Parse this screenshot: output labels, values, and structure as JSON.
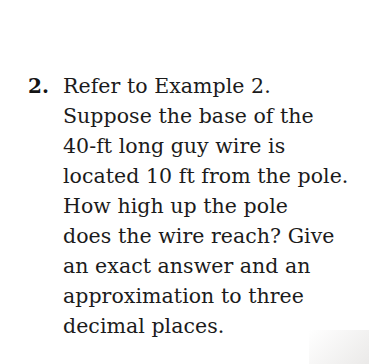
{
  "document": {
    "background_color": "#ffffff",
    "text_color": "#1b1b1b"
  },
  "problem": {
    "marker": "2.",
    "lines": [
      "Refer to Example 2.",
      "Suppose the base of the",
      "40-ft long guy wire is",
      "located 10 ft from the pole.",
      "How high up the pole",
      "does the wire reach? Give",
      "an exact answer and an",
      "approximation to three",
      "decimal places."
    ],
    "full_text": "Refer to Example 2. Suppose the base of the 40-ft long guy wire is located 10 ft from the pole. How high up the pole does the wire reach? Give an exact answer and an approximation to three decimal places."
  }
}
